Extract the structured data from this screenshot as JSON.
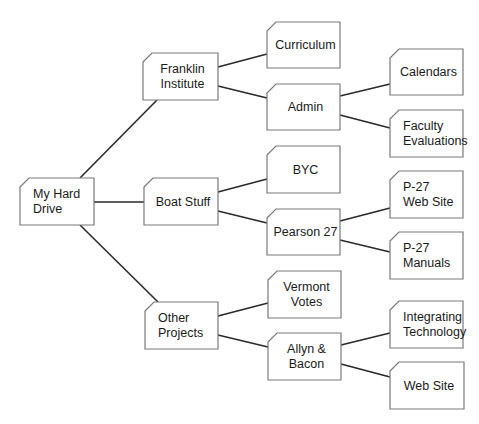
{
  "diagram": {
    "type": "folder-hierarchy-tree",
    "colors": {
      "background": "#ffffff",
      "box_border": "#7a7a7a",
      "connector": "#2a2a2a",
      "text": "#1a1a1a"
    },
    "nodes": [
      {
        "id": "root",
        "lines": [
          "My Hard Drive"
        ],
        "x": 20,
        "y": 178,
        "w": 74,
        "h": 47,
        "align": "left"
      },
      {
        "id": "franklin",
        "lines": [
          "Franklin",
          "Institute"
        ],
        "x": 143,
        "y": 53,
        "w": 75,
        "h": 47,
        "align": "center"
      },
      {
        "id": "boat",
        "lines": [
          "Boat Stuff"
        ],
        "x": 144,
        "y": 178,
        "w": 74,
        "h": 47,
        "align": "center"
      },
      {
        "id": "other",
        "lines": [
          "Other",
          "Projects"
        ],
        "x": 145,
        "y": 302,
        "w": 73,
        "h": 47,
        "align": "left"
      },
      {
        "id": "curriculum",
        "lines": [
          "Curriculum"
        ],
        "x": 267,
        "y": 22,
        "w": 73,
        "h": 46,
        "align": "center"
      },
      {
        "id": "admin",
        "lines": [
          "Admin"
        ],
        "x": 267,
        "y": 84,
        "w": 73,
        "h": 46,
        "align": "center"
      },
      {
        "id": "byc",
        "lines": [
          "BYC"
        ],
        "x": 267,
        "y": 146,
        "w": 73,
        "h": 47,
        "align": "center"
      },
      {
        "id": "pearson",
        "lines": [
          "Pearson 27"
        ],
        "x": 267,
        "y": 209,
        "w": 73,
        "h": 46,
        "align": "center"
      },
      {
        "id": "vermont",
        "lines": [
          "Vermont",
          "Votes"
        ],
        "x": 268,
        "y": 271,
        "w": 73,
        "h": 47,
        "align": "center"
      },
      {
        "id": "allyn",
        "lines": [
          "Allyn &",
          "Bacon"
        ],
        "x": 268,
        "y": 333,
        "w": 73,
        "h": 47,
        "align": "center"
      },
      {
        "id": "calendars",
        "lines": [
          "Calendars"
        ],
        "x": 390,
        "y": 49,
        "w": 73,
        "h": 46,
        "align": "center"
      },
      {
        "id": "faculty",
        "lines": [
          "Faculty",
          "Evaluations"
        ],
        "x": 390,
        "y": 110,
        "w": 73,
        "h": 47,
        "align": "left"
      },
      {
        "id": "p27web",
        "lines": [
          "P-27",
          "Web Site"
        ],
        "x": 390,
        "y": 171,
        "w": 73,
        "h": 47,
        "align": "left"
      },
      {
        "id": "p27manuals",
        "lines": [
          "P-27",
          "Manuals"
        ],
        "x": 390,
        "y": 232,
        "w": 73,
        "h": 47,
        "align": "left"
      },
      {
        "id": "integrating",
        "lines": [
          "Integrating",
          "Technology"
        ],
        "x": 390,
        "y": 301,
        "w": 73,
        "h": 47,
        "align": "left"
      },
      {
        "id": "website",
        "lines": [
          "Web Site"
        ],
        "x": 390,
        "y": 362,
        "w": 74,
        "h": 47,
        "align": "center"
      }
    ],
    "edges": [
      {
        "from": "root",
        "to": "franklin",
        "x1": 80,
        "y1": 178,
        "x2": 157,
        "y2": 100
      },
      {
        "from": "root",
        "to": "boat",
        "x1": 94,
        "y1": 202,
        "x2": 144,
        "y2": 202
      },
      {
        "from": "root",
        "to": "other",
        "x1": 80,
        "y1": 225,
        "x2": 158,
        "y2": 302
      },
      {
        "from": "franklin",
        "to": "curriculum",
        "x1": 218,
        "y1": 67,
        "x2": 267,
        "y2": 54
      },
      {
        "from": "franklin",
        "to": "admin",
        "x1": 218,
        "y1": 86,
        "x2": 267,
        "y2": 98
      },
      {
        "from": "admin",
        "to": "calendars",
        "x1": 340,
        "y1": 96,
        "x2": 390,
        "y2": 84
      },
      {
        "from": "admin",
        "to": "faculty",
        "x1": 340,
        "y1": 115,
        "x2": 390,
        "y2": 128
      },
      {
        "from": "boat",
        "to": "byc",
        "x1": 218,
        "y1": 192,
        "x2": 267,
        "y2": 179
      },
      {
        "from": "boat",
        "to": "pearson",
        "x1": 218,
        "y1": 211,
        "x2": 267,
        "y2": 223
      },
      {
        "from": "pearson",
        "to": "p27web",
        "x1": 340,
        "y1": 221,
        "x2": 390,
        "y2": 208
      },
      {
        "from": "pearson",
        "to": "p27manuals",
        "x1": 340,
        "y1": 240,
        "x2": 390,
        "y2": 252
      },
      {
        "from": "other",
        "to": "vermont",
        "x1": 218,
        "y1": 316,
        "x2": 268,
        "y2": 303
      },
      {
        "from": "other",
        "to": "allyn",
        "x1": 218,
        "y1": 335,
        "x2": 268,
        "y2": 347
      },
      {
        "from": "allyn",
        "to": "integrating",
        "x1": 341,
        "y1": 345,
        "x2": 390,
        "y2": 333
      },
      {
        "from": "allyn",
        "to": "website",
        "x1": 341,
        "y1": 364,
        "x2": 390,
        "y2": 377
      }
    ]
  }
}
